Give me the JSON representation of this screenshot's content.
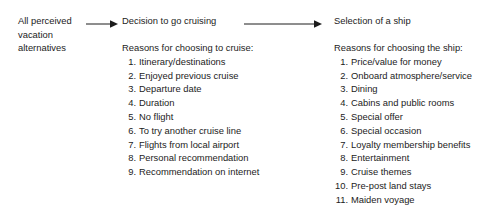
{
  "diagram": {
    "type": "flow-diagram",
    "orientation": "left-to-right",
    "text_color": "#1c1c1c",
    "background_color": "#ffffff",
    "nodes": [
      {
        "id": "source",
        "title_lines": [
          "All perceived",
          "vacation",
          "alternatives"
        ]
      },
      {
        "id": "decision-cruise",
        "title": "Decision to go cruising",
        "reasons_heading": "Reasons for choosing to cruise:",
        "reasons": [
          "Itinerary/destinations",
          "Enjoyed previous cruise",
          "Departure date",
          "Duration",
          "No flight",
          "To try another cruise line",
          "Flights from local airport",
          "Personal recommendation",
          "Recommendation on internet"
        ]
      },
      {
        "id": "selection-ship",
        "title": "Selection of a ship",
        "reasons_heading": "Reasons for choosing the ship:",
        "reasons": [
          "Price/value for money",
          "Onboard atmosphere/service",
          "Dining",
          "Cabins and public rooms",
          "Special offer",
          "Special occasion",
          "Loyalty membership benefits",
          "Entertainment",
          "Cruise themes",
          "Pre-post land stays",
          "Maiden voyage"
        ]
      }
    ],
    "connectors": [
      {
        "id": "arrow-1",
        "from": "source",
        "to": "decision-cruise",
        "glyph": "right-arrow-icon"
      },
      {
        "id": "arrow-2",
        "from": "decision-cruise",
        "to": "selection-ship",
        "glyph": "right-arrow-icon"
      }
    ]
  }
}
